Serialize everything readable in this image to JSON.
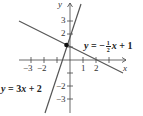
{
  "figure": {
    "axes": {
      "x_label": "x",
      "y_label": "y",
      "x_ticks": [
        {
          "value": -3,
          "label": "−3"
        },
        {
          "value": -2,
          "label": "−2"
        },
        {
          "value": 1,
          "label": "1"
        },
        {
          "value": 2,
          "label": "2"
        }
      ],
      "y_ticks": [
        {
          "value": 3,
          "label": "3"
        },
        {
          "value": 2,
          "label": "2"
        },
        {
          "value": -2,
          "label": "−2"
        },
        {
          "value": -3,
          "label": "−3"
        }
      ]
    },
    "lines": [
      {
        "equation": "y = 3x + 2",
        "eq_prefix": "y",
        "eq_eq": " = 3",
        "eq_var": "x",
        "eq_rest": " + 2",
        "slope": 3,
        "intercept": 2
      },
      {
        "equation": "y = −1/2 x + 1",
        "eq_prefix": "y",
        "eq_eq": " = −",
        "frac_num": "1",
        "frac_den": "2",
        "eq_var": "x",
        "eq_rest": " + 1",
        "slope": -0.5,
        "intercept": 1
      }
    ],
    "intersection": {
      "x": -0.29,
      "y": 1.14
    }
  }
}
